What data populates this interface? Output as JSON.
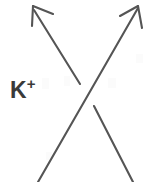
{
  "figure": {
    "kind": "knot-crossing-diagram",
    "width": 156,
    "height": 182,
    "background_color": "#ffffff",
    "stroke_color": "#555555",
    "stroke_width": 2.1,
    "label": {
      "base": "K",
      "sign": "+",
      "full_text": "K+",
      "color": "#3a3a3a",
      "x": 10,
      "y": 76
    },
    "strands": [
      {
        "name": "over-strand",
        "description": "continuous strand running from bottom-left to top-right, passing over the crossing",
        "relation": "over",
        "path": "M 38 182 L 138 8",
        "arrow": {
          "present": true,
          "direction": "up-right",
          "tip_x": 138,
          "tip_y": 6,
          "barb1": "M 138 6 L 120 16",
          "barb2": "M 138 6 L 142 28"
        }
      },
      {
        "name": "under-strand-upper",
        "description": "upper-left portion of the strand that passes under the crossing; terminates before the over-strand",
        "relation": "under",
        "path": "M 34 10 L 80 84",
        "arrow": {
          "present": true,
          "direction": "up-left",
          "tip_x": 33,
          "tip_y": 6,
          "barb1": "M 33 6 L 32 26",
          "barb2": "M 33 6 L 53 14"
        }
      },
      {
        "name": "under-strand-lower",
        "description": "lower-right portion of the strand that passes under the crossing; resumes after the break",
        "relation": "under",
        "path": "M 94 106 L 133 182",
        "arrow": {
          "present": false
        }
      }
    ],
    "crossing": {
      "name": "positive-crossing",
      "center_x": 87,
      "center_y": 95,
      "break_gap_px": 26,
      "sign": "+"
    }
  }
}
